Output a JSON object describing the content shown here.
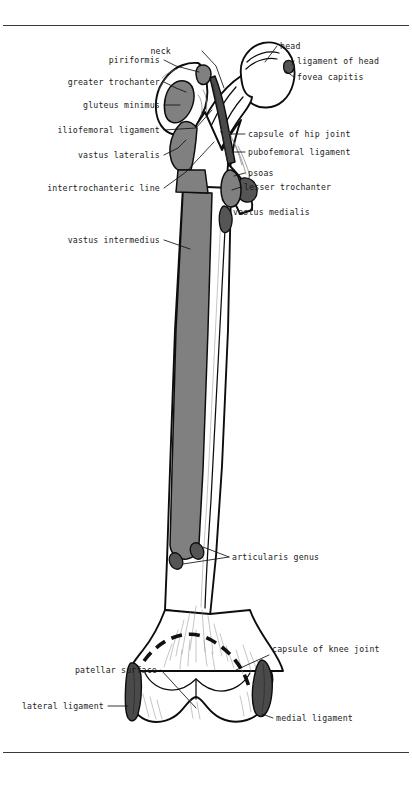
{
  "figure": {
    "background_color": "#ffffff",
    "ink_color": "#0d0d0d",
    "muscle_fill_color": "#808080",
    "ligament_fill_color": "#4a4a4a"
  },
  "labels_left": [
    {
      "id": "piriformis",
      "text": "piriformis"
    },
    {
      "id": "greater-trochanter",
      "text": "greater trochanter"
    },
    {
      "id": "gluteus-minimus",
      "text": "gluteus minimus"
    },
    {
      "id": "iliofemoral-ligament",
      "text": "iliofemoral ligament"
    },
    {
      "id": "vastus-lateralis",
      "text": "vastus lateralis"
    },
    {
      "id": "intertrochanteric-line",
      "text": "intertrochanteric line"
    },
    {
      "id": "vastus-intermedius",
      "text": "vastus intermedius"
    },
    {
      "id": "patellar-surface",
      "text": "patellar surface"
    },
    {
      "id": "lateral-ligament",
      "text": "lateral ligament"
    }
  ],
  "labels_top": [
    {
      "id": "neck",
      "text": "neck"
    }
  ],
  "labels_right": [
    {
      "id": "head",
      "text": "head"
    },
    {
      "id": "ligament-of-head",
      "text": "ligament of head"
    },
    {
      "id": "fovea-capitis",
      "text": "fovea capitis"
    },
    {
      "id": "capsule-of-hip-joint",
      "text": "capsule of hip joint"
    },
    {
      "id": "pubofemoral-ligament",
      "text": "pubofemoral ligament"
    },
    {
      "id": "psoas",
      "text": "psoas"
    },
    {
      "id": "lesser-trochanter",
      "text": "lesser trochanter"
    },
    {
      "id": "vastus-medialis",
      "text": "vastus medialis"
    },
    {
      "id": "articularis-genus",
      "text": "articularis genus"
    },
    {
      "id": "capsule-of-knee-joint",
      "text": "capsule of knee joint"
    },
    {
      "id": "medial-ligament",
      "text": "medial ligament"
    }
  ]
}
